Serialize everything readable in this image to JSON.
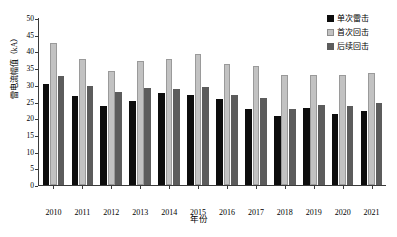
{
  "chart_data": {
    "type": "bar",
    "title": "",
    "xlabel": "年份",
    "ylabel": "雷电流幅值（kA）",
    "categories": [
      "2010",
      "2011",
      "2012",
      "2013",
      "2014",
      "2015",
      "2016",
      "2017",
      "2018",
      "2019",
      "2020",
      "2021"
    ],
    "ylim": [
      0,
      50
    ],
    "yticks": [
      0,
      5,
      10,
      15,
      20,
      25,
      30,
      35,
      40,
      45,
      50
    ],
    "grid": false,
    "legend_position": "top-right",
    "series": [
      {
        "name": "单次雷击",
        "color": "#0d0d0d",
        "values": [
          30.2,
          26.6,
          23.6,
          25.2,
          27.4,
          27.0,
          25.9,
          22.8,
          20.8,
          23.0,
          21.3,
          22.1
        ]
      },
      {
        "name": "首次回击",
        "color": "#c2c2c2",
        "values": [
          42.5,
          37.7,
          34.1,
          37.2,
          37.8,
          39.2,
          36.2,
          35.7,
          32.8,
          33.0,
          32.8,
          33.6
        ]
      },
      {
        "name": "后续回击",
        "color": "#5c5c5c",
        "values": [
          32.5,
          29.6,
          27.9,
          28.9,
          28.6,
          29.3,
          27.1,
          26.2,
          22.7,
          24.1,
          23.7,
          24.5
        ]
      }
    ]
  }
}
